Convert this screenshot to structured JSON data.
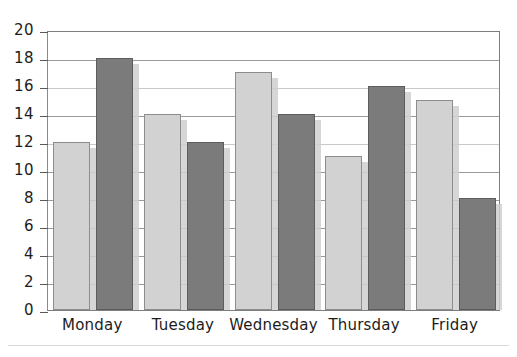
{
  "chart_data": {
    "type": "bar",
    "title": "",
    "subtitle": "",
    "xlabel": "",
    "ylabel": "",
    "categories": [
      "Monday",
      "Tuesday",
      "Wednesday",
      "Thursday",
      "Friday"
    ],
    "series": [
      {
        "name": "Series 1",
        "color": "#d2d2d2",
        "values": [
          12,
          14,
          17,
          11,
          15
        ]
      },
      {
        "name": "Series 2",
        "color": "#7b7b7b",
        "values": [
          18,
          12,
          14,
          16,
          8
        ]
      }
    ],
    "ylim": [
      0,
      20
    ],
    "ytick_step": 2,
    "ytick_labels": [
      "0",
      "2",
      "4",
      "6",
      "8",
      "10",
      "12",
      "14",
      "16",
      "18",
      "20"
    ],
    "grid": true,
    "grid_axis": "y",
    "legend": "none",
    "axis_color": "#7d7d7d",
    "text_color": "#1c1c1c",
    "background": "#ffffff"
  }
}
